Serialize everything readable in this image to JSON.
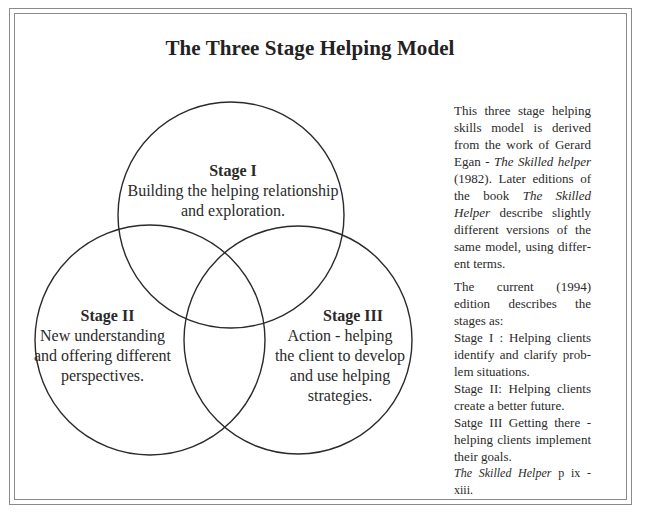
{
  "title": "The Three Stage Helping Model",
  "colors": {
    "stroke": "#2a2a2a",
    "frame": "#8a8a8a",
    "background": "#ffffff",
    "text": "#2a2a2a"
  },
  "venn": {
    "circles": [
      {
        "id": "stage-1",
        "cx": 231,
        "cy": 215,
        "r": 113
      },
      {
        "id": "stage-2",
        "cx": 150,
        "cy": 340,
        "r": 115
      },
      {
        "id": "stage-3",
        "cx": 298,
        "cy": 340,
        "r": 114
      }
    ]
  },
  "stages": [
    {
      "name": "Stage I",
      "description": "Building the helping relationship\nand exploration."
    },
    {
      "name": "Stage II",
      "description": "New understanding\nand offering different\nperspectives."
    },
    {
      "name": "Stage III",
      "description": "Action - helping\nthe client to develop\nand use helping\nstrategies."
    }
  ],
  "sidebar": {
    "paragraph1": {
      "part1": "This three stage helping skills model is derived from the work of Gerard Egan - ",
      "book1": "The Skilled helper",
      "part2": " (1982).  Later editions of the book ",
      "book2": "The Skilled Helper",
      "part3": " describe slightly different versions of the same model, using differ­ent terms."
    },
    "paragraph2": {
      "intro": "The current (1994) edition describes the stages as:",
      "stage1": "Stage I : Helping clients identify and clarify prob­lem situations.",
      "stage2": "Stage II: Helping clients create a better future.",
      "stage3": "Satge III Getting there - helping clients implement their goals.",
      "citation_book": "The Skilled Helper",
      "citation_pages": " p ix - xiii."
    }
  }
}
